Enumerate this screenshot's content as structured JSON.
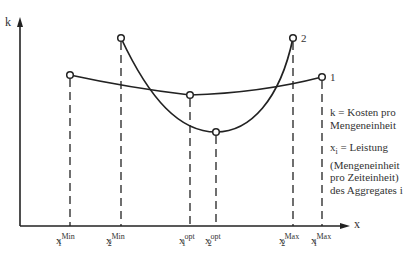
{
  "axes": {
    "y_label": "k",
    "x_label": "x"
  },
  "curves": [
    {
      "id": "1",
      "label": "1",
      "points": {
        "min": [
          70,
          75
        ],
        "opt": [
          190,
          95
        ],
        "max": [
          322,
          77
        ]
      }
    },
    {
      "id": "2",
      "label": "2",
      "points": {
        "min": [
          121,
          38
        ],
        "opt": [
          216,
          132
        ],
        "max": [
          293,
          38
        ]
      }
    }
  ],
  "x_ticks": [
    {
      "base": "x",
      "sub": "1",
      "sup": "Min",
      "x": 70
    },
    {
      "base": "x",
      "sub": "2",
      "sup": "Min",
      "x": 121
    },
    {
      "base": "x",
      "sub": "1",
      "sup": "opt",
      "x": 190
    },
    {
      "base": "x",
      "sub": "2",
      "sup": "opt",
      "x": 216
    },
    {
      "base": "x",
      "sub": "2",
      "sup": "Max",
      "x": 293
    },
    {
      "base": "x",
      "sub": "1",
      "sup": "Max",
      "x": 322
    }
  ],
  "legend": {
    "k_def": "k = Kosten pro Mengeneinheit",
    "x_def_1": "x",
    "x_def_sub": "i",
    "x_def_2": " = Leistung (Mengeneinheit pro Zeiteinheit) des Aggregates i"
  }
}
